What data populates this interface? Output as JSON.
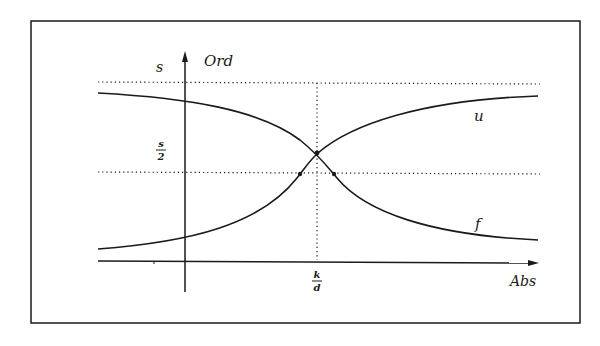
{
  "diagram": {
    "type": "function-plot",
    "axes": {
      "x_label": "Abs",
      "y_label": "Ord"
    },
    "levels": {
      "upper_label": "s",
      "half_label_num": "s",
      "half_label_den": "2"
    },
    "x_marker": {
      "num": "k",
      "den": "d"
    },
    "curves": [
      {
        "name": "u",
        "description": "increasing sigmoid-like curve approaching s from below"
      },
      {
        "name": "f",
        "description": "decreasing curve approaching 0 from above"
      }
    ],
    "colors": {
      "stroke": "#1a1a1a",
      "background": "#ffffff"
    }
  }
}
